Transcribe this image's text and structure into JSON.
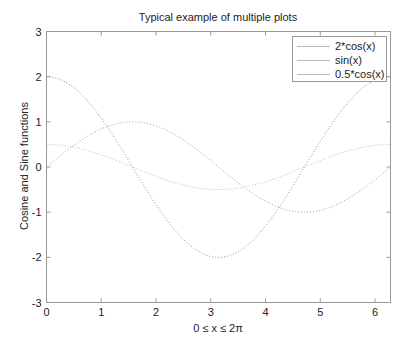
{
  "chart_data": {
    "type": "line",
    "title": "Typical example of multiple plots",
    "xlabel": "0 ≤ x ≤ 2π",
    "ylabel": "Cosine and Sine functions",
    "xlim": [
      0,
      6.2832
    ],
    "ylim": [
      -3,
      3
    ],
    "xticks": [
      0,
      1,
      2,
      3,
      4,
      5,
      6
    ],
    "yticks": [
      -3,
      -2,
      -1,
      0,
      1,
      2,
      3
    ],
    "grid": false,
    "legend_position": "upper right",
    "series": [
      {
        "name": "2*cos(x)",
        "function": "2*cos(x)",
        "style": "dotted",
        "color": "#8a8a8a",
        "x": [
          0,
          0.785,
          1.571,
          2.356,
          3.142,
          3.927,
          4.712,
          5.498,
          6.283
        ],
        "values": [
          2,
          1.414,
          0,
          -1.414,
          -2,
          -1.414,
          0,
          1.414,
          2
        ]
      },
      {
        "name": "sin(x)",
        "function": "sin(x)",
        "style": "dotted",
        "color": "#a0a0a0",
        "x": [
          0,
          0.785,
          1.571,
          2.356,
          3.142,
          3.927,
          4.712,
          5.498,
          6.283
        ],
        "values": [
          0,
          0.707,
          1,
          0.707,
          0,
          -0.707,
          -1,
          -0.707,
          0
        ]
      },
      {
        "name": "0.5*cos(x)",
        "function": "0.5*cos(x)",
        "style": "dotted",
        "color": "#b8b8b8",
        "x": [
          0,
          0.785,
          1.571,
          2.356,
          3.142,
          3.927,
          4.712,
          5.498,
          6.283
        ],
        "values": [
          0.5,
          0.354,
          0,
          -0.354,
          -0.5,
          -0.354,
          0,
          0.354,
          0.5
        ]
      }
    ]
  },
  "legend": {
    "items": [
      {
        "label": "2*cos(x)"
      },
      {
        "label": "sin(x)"
      },
      {
        "label": "0.5*cos(x)"
      }
    ]
  }
}
